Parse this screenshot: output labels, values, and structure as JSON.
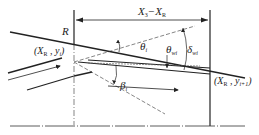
{
  "diagram": {
    "labels": {
      "R": "R",
      "dimension": {
        "a": "X",
        "a_sub": "3",
        "dash": "−",
        "b": "X",
        "b_sub": "R"
      },
      "inlet_point": {
        "open": "(",
        "x": "X",
        "x_sub": "R",
        "comma": " , ",
        "y": "y",
        "y_sub": "i",
        "close": ")"
      },
      "outlet_point": {
        "open": "(",
        "x": "X",
        "x_sub": "R",
        "comma": " , ",
        "y": "y",
        "y_sub": "i+1",
        "close": ")"
      },
      "theta_i": {
        "sym": "θ",
        "sub": "i"
      },
      "theta_wi": {
        "sym": "θ",
        "sub": "wi"
      },
      "delta_wi": {
        "sym": "δ",
        "sub": "wi"
      },
      "beta_i": {
        "sym": "β",
        "sub": "i"
      }
    },
    "colors": {
      "line": "#222222",
      "background": "#ffffff"
    }
  }
}
